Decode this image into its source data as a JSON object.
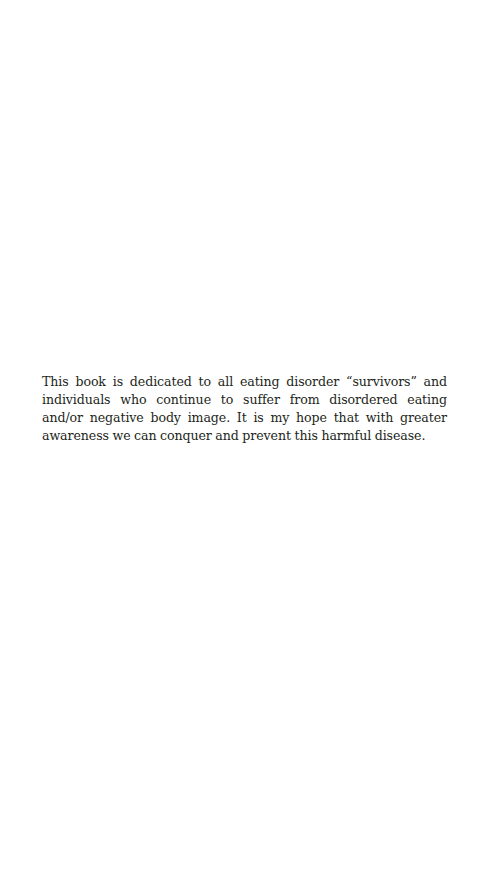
{
  "page": {
    "type": "dedication",
    "dedication_text": "This book is dedicated to all eating disorder “survivors” and individuals who continue to suffer from disordered eating and/or negative body image. It is my hope that with greater awareness we can conquer and prevent this harmful disease."
  }
}
